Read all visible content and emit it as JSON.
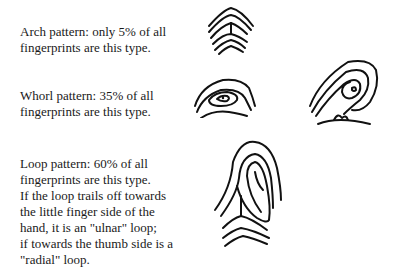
{
  "sections": {
    "arch": {
      "lines": [
        "Arch pattern:  only 5% of all",
        "fingerprints are this type."
      ],
      "icon": "arch-fingerprint-drawing"
    },
    "whorl": {
      "lines": [
        "Whorl pattern:  35% of all",
        "fingerprints are this type."
      ],
      "icons": [
        "whorl-fingerprint-drawing",
        "whorl-fingerprint-drawing-2"
      ]
    },
    "loop": {
      "lines": [
        "Loop pattern:  60% of all",
        "fingerprints are this type.",
        "If the loop trails off towards",
        "the little finger side of the",
        "hand, it is an \"ulnar\" loop;",
        "if towards the thumb side is a",
        "\"radial\" loop."
      ],
      "icon": "loop-fingerprint-drawing"
    }
  }
}
